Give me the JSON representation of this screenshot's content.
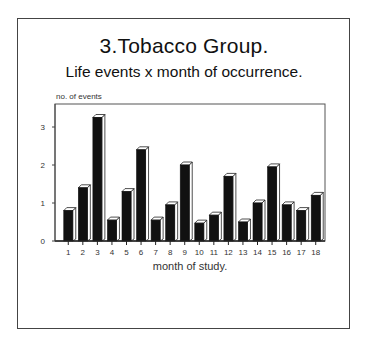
{
  "chart_data": {
    "type": "bar",
    "title": "3.Tobacco Group.",
    "subtitle": "Life events x month of occurrence.",
    "xlabel": "month of study.",
    "ylabel": "no. of events",
    "categories": [
      "1",
      "2",
      "3",
      "4",
      "5",
      "6",
      "7",
      "8",
      "9",
      "10",
      "11",
      "12",
      "13",
      "14",
      "15",
      "16",
      "17",
      "18"
    ],
    "values": [
      0.8,
      1.4,
      3.25,
      0.55,
      1.3,
      2.4,
      0.55,
      0.95,
      2.0,
      0.47,
      0.68,
      1.7,
      0.5,
      1.0,
      1.95,
      0.95,
      0.8,
      1.2
    ],
    "ylim": [
      0,
      3.6
    ],
    "yticks": [
      "0",
      "1",
      "2",
      "3"
    ],
    "grid": false,
    "legend": "none",
    "bar_style": "3d-black",
    "colors": {
      "bar": "#111111",
      "bar_edge": "#ffffff",
      "axis": "#444444"
    }
  }
}
